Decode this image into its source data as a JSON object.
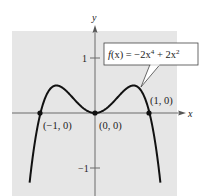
{
  "chart_data": {
    "type": "line",
    "title": "",
    "function_label": "f(x) = -2x^4 + 2x^2",
    "function_label_parts": {
      "prefix": "f(x) = −2x",
      "exp1": "4",
      "middle": " + 2x",
      "exp2": "2"
    },
    "xlabel": "x",
    "ylabel": "y",
    "xlim": [
      -1.02,
      1.52
    ],
    "ylim": [
      -1.51,
      1.5
    ],
    "grid": false,
    "background": "#e6e6e6",
    "curve_color": "#111111",
    "y_ticks": [
      {
        "value": 1,
        "label": "1"
      },
      {
        "value": -1,
        "label": "−1"
      }
    ],
    "series": [
      {
        "name": "f(x) = -2x^4 + 2x^2",
        "x": [
          -1.2,
          -1.1,
          -1.0,
          -0.9,
          -0.8,
          -0.7071,
          -0.6,
          -0.5,
          -0.4,
          -0.3,
          -0.2,
          -0.1,
          0,
          0.1,
          0.2,
          0.3,
          0.4,
          0.5,
          0.6,
          0.7071,
          0.8,
          0.9,
          1.0,
          1.1,
          1.2
        ],
        "y": [
          -1.267,
          -0.508,
          0,
          0.308,
          0.461,
          0.5,
          0.461,
          0.375,
          0.269,
          0.164,
          0.077,
          0.02,
          0,
          0.02,
          0.077,
          0.164,
          0.269,
          0.375,
          0.461,
          0.5,
          0.461,
          0.308,
          0,
          -0.508,
          -1.267
        ]
      }
    ],
    "points": [
      {
        "x": -1,
        "y": 0,
        "label": "(−1, 0)"
      },
      {
        "x": 0,
        "y": 0,
        "label": "(0, 0)"
      },
      {
        "x": 1,
        "y": 0,
        "label": "(1, 0)"
      }
    ]
  }
}
